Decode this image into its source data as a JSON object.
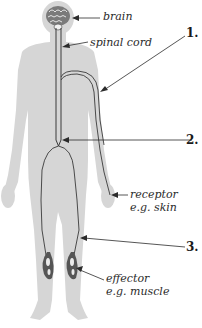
{
  "colors": {
    "silhouette": "#d4d4d4",
    "nerve": "#3a3a3a",
    "text": "#2b2b2b",
    "brain": "#6a6a6a",
    "muscle": "#5a5a5a"
  },
  "labels": {
    "brain": "brain",
    "spinal_cord": "spinal cord",
    "receptor": "receptor",
    "receptor_example": "e.g. skin",
    "effector": "effector",
    "effector_example": "e.g. muscle"
  },
  "numbers": {
    "n1": "1.",
    "n2": "2.",
    "n3": "3."
  }
}
